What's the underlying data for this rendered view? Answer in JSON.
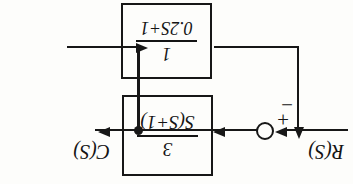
{
  "figure": {
    "orientation": "rotated-180",
    "ink_color": "#171717",
    "background_color": "#fdfdfb"
  },
  "blocks": [
    {
      "id": "forward-block",
      "name": "forward-path-transfer-function",
      "numerator": "3",
      "denominator": "S(S+1)",
      "transfer_function": "3/(S(S+1))"
    },
    {
      "id": "feedback-block",
      "name": "feedback-path-transfer-function",
      "numerator": "1",
      "denominator": "0.2S+1",
      "transfer_function": "1/(0.2S+1)"
    }
  ],
  "summing_junction": {
    "name": "summing-junction",
    "plus_sign": "+",
    "minus_sign": "−",
    "plus_input": "R(S)",
    "minus_input": "feedback"
  },
  "signals": {
    "input_label": "R(S)",
    "output_label": "C(S)"
  },
  "nodes": {
    "takeoff_point": "output-takeoff-node"
  }
}
